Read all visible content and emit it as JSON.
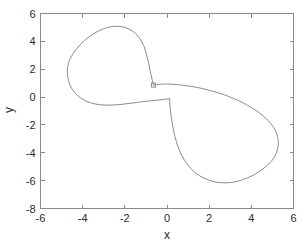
{
  "chart_data": {
    "type": "line",
    "title": "",
    "subtitle": "",
    "xlabel": "x",
    "ylabel": "y",
    "xlim": [
      -6,
      6
    ],
    "ylim": [
      -8,
      6
    ],
    "xticks": [
      -6,
      -4,
      -2,
      0,
      2,
      4,
      6
    ],
    "yticks": [
      -8,
      -6,
      -4,
      -2,
      0,
      2,
      4,
      6
    ],
    "xticklabels": [
      "-6",
      "-4",
      "-2",
      "0",
      "2",
      "4",
      "6"
    ],
    "yticklabels": [
      "-8",
      "-6",
      "-4",
      "-2",
      "0",
      "2",
      "4",
      "6"
    ],
    "grid": false,
    "legend": null,
    "legend_position": "none",
    "box": true,
    "series": [
      {
        "name": "trajectory",
        "color": "#8c8c8c",
        "linewidth": 1,
        "closed": true,
        "marker": {
          "name": "start-point",
          "shape": "square",
          "filled": false,
          "x": -0.64,
          "y": 0.86,
          "size": 4
        },
        "points": [
          [
            -0.64,
            0.86
          ],
          [
            -0.3,
            0.92
          ],
          [
            0.1,
            0.93
          ],
          [
            0.7,
            0.86
          ],
          [
            1.4,
            0.7
          ],
          [
            2.1,
            0.45
          ],
          [
            2.8,
            0.12
          ],
          [
            3.45,
            -0.3
          ],
          [
            4.05,
            -0.8
          ],
          [
            4.6,
            -1.4
          ],
          [
            5.0,
            -2.05
          ],
          [
            5.22,
            -2.7
          ],
          [
            5.28,
            -3.35
          ],
          [
            5.2,
            -3.95
          ],
          [
            4.98,
            -4.55
          ],
          [
            4.6,
            -5.1
          ],
          [
            4.1,
            -5.6
          ],
          [
            3.5,
            -5.98
          ],
          [
            2.9,
            -6.15
          ],
          [
            2.3,
            -6.1
          ],
          [
            1.8,
            -5.85
          ],
          [
            1.35,
            -5.45
          ],
          [
            1.0,
            -4.9
          ],
          [
            0.72,
            -4.25
          ],
          [
            0.52,
            -3.55
          ],
          [
            0.38,
            -2.85
          ],
          [
            0.28,
            -2.15
          ],
          [
            0.2,
            -1.45
          ],
          [
            0.15,
            -0.75
          ],
          [
            0.12,
            -0.18
          ],
          [
            0.1,
            -0.12
          ],
          [
            -0.45,
            -0.22
          ],
          [
            -1.1,
            -0.32
          ],
          [
            -1.75,
            -0.45
          ],
          [
            -2.35,
            -0.55
          ],
          [
            -2.9,
            -0.58
          ],
          [
            -3.4,
            -0.5
          ],
          [
            -3.85,
            -0.28
          ],
          [
            -4.25,
            0.12
          ],
          [
            -4.55,
            0.7
          ],
          [
            -4.7,
            1.4
          ],
          [
            -4.72,
            2.1
          ],
          [
            -4.58,
            2.8
          ],
          [
            -4.3,
            3.45
          ],
          [
            -3.92,
            4.05
          ],
          [
            -3.45,
            4.58
          ],
          [
            -2.92,
            4.95
          ],
          [
            -2.4,
            5.08
          ],
          [
            -1.95,
            4.98
          ],
          [
            -1.58,
            4.68
          ],
          [
            -1.3,
            4.22
          ],
          [
            -1.1,
            3.68
          ],
          [
            -0.98,
            3.1
          ],
          [
            -0.88,
            2.5
          ],
          [
            -0.8,
            1.9
          ],
          [
            -0.72,
            1.35
          ],
          [
            -0.64,
            0.86
          ]
        ]
      }
    ]
  },
  "axes": {
    "x_title": "x",
    "y_title": "y"
  }
}
